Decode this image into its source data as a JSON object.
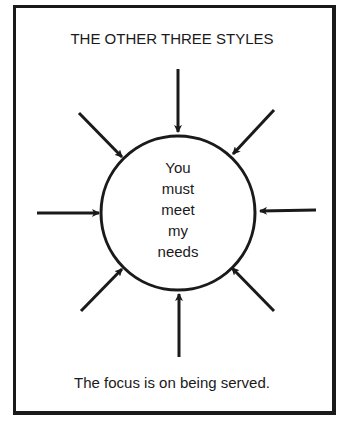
{
  "diagram": {
    "title": "THE OTHER THREE STYLES",
    "center": {
      "shape": "circle",
      "lines": [
        "You",
        "must",
        "meet",
        "my",
        "needs"
      ]
    },
    "arrows": {
      "count": 8,
      "direction": "inward",
      "positions": [
        "top",
        "top-right",
        "right",
        "bottom-right",
        "bottom",
        "bottom-left",
        "left",
        "top-left"
      ]
    },
    "caption": "The focus is on being served.",
    "colors": {
      "ink": "#1a1a1a",
      "background": "#ffffff"
    }
  }
}
